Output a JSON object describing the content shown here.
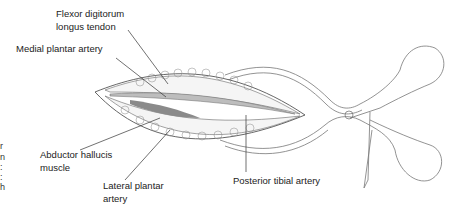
{
  "figure": {
    "labels": {
      "flexor_line1": "Flexor digitorum",
      "flexor_line2": "longus tendon",
      "medial": "Medial plantar artery",
      "abductor_line1": "Abductor hallucis",
      "abductor_line2": "muscle",
      "lateral_line1": "Lateral plantar",
      "lateral_line2": "artery",
      "posterior": "Posterior tibial artery"
    },
    "left_fragments": [
      "r",
      "n",
      ":",
      ":",
      "h"
    ],
    "retractor_marker": "①",
    "colors": {
      "line": "#555555",
      "muscle": "#8a8a8a",
      "tendon": "#bdbdbd",
      "text": "#222222"
    }
  }
}
